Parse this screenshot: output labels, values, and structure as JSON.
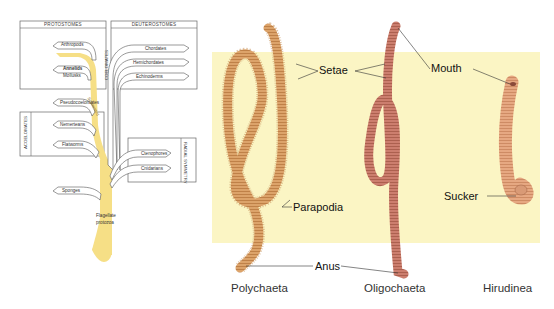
{
  "cladogram": {
    "groups": {
      "protostomes": "PROTOSTOMES",
      "deuterostomes": "DEUTEROSTOMES",
      "coelomates": "COELOMATES",
      "acoelomates": "ACOELOMATES",
      "radial_symmetry": "RADIAL SYMMETRY"
    },
    "taxa": {
      "arthropods": "Arthropods",
      "annelids": "Annelids",
      "mollusks": "Mollusks",
      "pseudocoelomates": "Pseudocoelomates",
      "nemerteans": "Nemerteans",
      "flatworms": "Flatworms",
      "sponges": "Sponges",
      "chordates": "Chordates",
      "hemichordates": "Hemichordates",
      "echinoderms": "Echinoderms",
      "ctenophores": "Ctenophores",
      "cnidarians": "Cnidarians"
    },
    "trunk_label": "Segmented",
    "root": [
      "Flagellate",
      "protozoa"
    ],
    "highlight_color": "#f6df86"
  },
  "figure": {
    "panel_color": "#fbf5c4",
    "labels": {
      "setae": "Setae",
      "mouth": "Mouth",
      "parapodia": "Parapodia",
      "sucker": "Sucker",
      "anus": "Anus"
    },
    "captions": {
      "polychaeta": "Polychaeta",
      "oligochaeta": "Oligochaeta",
      "hirudinea": "Hirudinea"
    },
    "colors": {
      "polychaete": "#d9a26a",
      "oligochaete": "#c97a6a",
      "leech": "#e2a37a"
    }
  }
}
